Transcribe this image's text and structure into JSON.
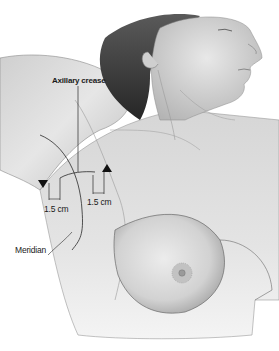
{
  "figure": {
    "labels": {
      "axillary_crease": "Axillary crease",
      "left_measure": "1.5 cm",
      "right_measure": "1.5 cm",
      "meridian": "Meridian"
    },
    "colors": {
      "skin_light": "#e9e9e9",
      "skin_mid": "#c8c8c8",
      "skin_dark": "#8c8c8c",
      "hair": "#3a3a3a",
      "line": "#2a2a2a"
    }
  }
}
